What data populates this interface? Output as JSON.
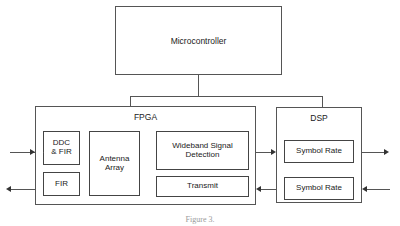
{
  "figure": {
    "type": "block-diagram",
    "caption": "Figure 3.",
    "background_color": "#ffffff",
    "line_color": "#555555",
    "text_color": "#1a1a1a"
  },
  "blocks": {
    "microcontroller": {
      "label": "Microcontroller"
    },
    "fpga": {
      "label": "FPGA",
      "modules": [
        {
          "label": "DDC\n& FIR"
        },
        {
          "label": "FIR"
        },
        {
          "label": "Antenna\nArray"
        },
        {
          "label": "Wideband Signal\nDetection"
        },
        {
          "label": "Transmit"
        }
      ]
    },
    "dsp": {
      "label": "DSP",
      "modules": [
        {
          "label": "Symbol Rate"
        },
        {
          "label": "Symbol Rate"
        }
      ]
    }
  },
  "connections": [
    {
      "name": "input-receive",
      "direction": "right",
      "from": "external",
      "to": "fpga"
    },
    {
      "name": "output-transmit",
      "direction": "left",
      "from": "fpga",
      "to": "external"
    },
    {
      "name": "fpga-to-dsp",
      "direction": "right",
      "from": "fpga",
      "to": "dsp"
    },
    {
      "name": "dsp-to-fpga",
      "direction": "left",
      "from": "dsp",
      "to": "fpga"
    },
    {
      "name": "dsp-output",
      "direction": "right",
      "from": "dsp",
      "to": "external"
    },
    {
      "name": "dsp-input",
      "direction": "left",
      "from": "external",
      "to": "dsp"
    },
    {
      "name": "microcontroller-bus",
      "direction": "none",
      "from": "microcontroller",
      "to": "fpga-and-dsp"
    }
  ]
}
